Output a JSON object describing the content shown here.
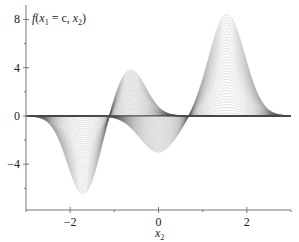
{
  "chart_data": {
    "type": "line",
    "title": "",
    "ylabel_parts": {
      "f": "f",
      "open": "(",
      "x1": "x",
      "sub1": "1",
      "eq": " = c, ",
      "x2": "x",
      "sub2": "2",
      "close": ")"
    },
    "ylabel": "f(x1 = c, x2)",
    "xlabel": "x2",
    "xlabel_parts": {
      "x": "x",
      "sub": "2"
    },
    "xlim": [
      -3,
      3
    ],
    "ylim": [
      -7.8,
      9.2
    ],
    "x_ticks": [
      -2,
      0,
      2
    ],
    "x_tick_labels": [
      "−2",
      "0",
      "2"
    ],
    "x_minor_ticks": [
      -3,
      -1,
      1,
      3
    ],
    "y_ticks": [
      8,
      4,
      0,
      -4
    ],
    "y_tick_labels": [
      "8",
      "4",
      "0",
      "−4"
    ],
    "y_minor_ticks": [
      6,
      2,
      -2,
      -6
    ],
    "grid": false,
    "legend": "none",
    "series_description": "Family of curves f(x1=c, x2) for varying c; envelope features",
    "features": [
      {
        "name": "peak-left",
        "x2": -0.65,
        "value": 3.9
      },
      {
        "name": "trough-left",
        "x2": -1.7,
        "value": -6.5
      },
      {
        "name": "trough-center",
        "x2": 0.0,
        "value": -3.0
      },
      {
        "name": "peak-right",
        "x2": 1.55,
        "value": 8.4
      }
    ],
    "num_curves_per_family": 36
  }
}
